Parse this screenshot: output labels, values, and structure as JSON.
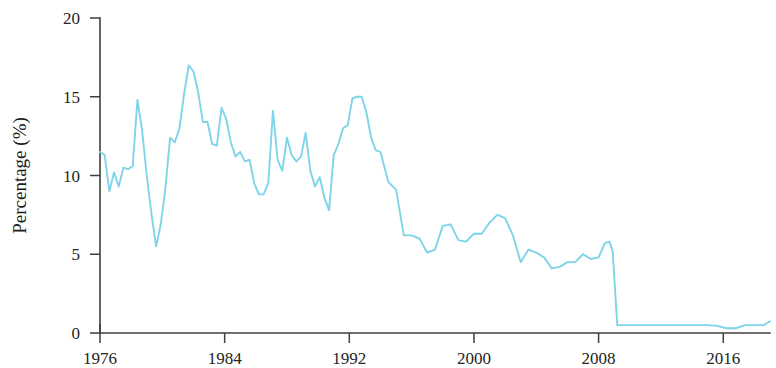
{
  "chart_data": {
    "type": "line",
    "title": "",
    "xlabel": "",
    "ylabel": "Percentage (%)",
    "xlim": [
      1976,
      2019
    ],
    "ylim": [
      0,
      20
    ],
    "xticks": [
      1976,
      1984,
      1992,
      2000,
      2008,
      2016
    ],
    "xtick_labels": [
      "1976",
      "1984",
      "1992",
      "2000",
      "2008",
      "2016"
    ],
    "yticks": [
      0,
      5,
      10,
      15,
      20
    ],
    "ytick_labels": [
      "0",
      "5",
      "10",
      "15",
      "20"
    ],
    "grid": false,
    "legend": false,
    "series": [
      {
        "name": "Percentage",
        "color": "#7ed4e8",
        "x": [
          1976.0,
          1976.3,
          1976.6,
          1976.9,
          1977.2,
          1977.5,
          1977.8,
          1978.1,
          1978.4,
          1978.7,
          1979.0,
          1979.3,
          1979.6,
          1979.9,
          1980.2,
          1980.5,
          1980.8,
          1981.1,
          1981.4,
          1981.7,
          1982.0,
          1982.3,
          1982.6,
          1982.9,
          1983.2,
          1983.5,
          1983.8,
          1984.1,
          1984.4,
          1984.7,
          1985.0,
          1985.3,
          1985.6,
          1985.9,
          1986.2,
          1986.5,
          1986.8,
          1987.1,
          1987.4,
          1987.7,
          1988.0,
          1988.3,
          1988.6,
          1988.9,
          1989.2,
          1989.5,
          1989.8,
          1990.1,
          1990.4,
          1990.7,
          1991.0,
          1991.3,
          1991.6,
          1991.9,
          1992.2,
          1992.5,
          1992.8,
          1993.1,
          1993.4,
          1993.7,
          1994.0,
          1994.5,
          1995.0,
          1995.5,
          1996.0,
          1996.5,
          1997.0,
          1997.5,
          1998.0,
          1998.5,
          1999.0,
          1999.5,
          2000.0,
          2000.5,
          2001.0,
          2001.5,
          2002.0,
          2002.5,
          2003.0,
          2003.5,
          2004.0,
          2004.5,
          2005.0,
          2005.5,
          2006.0,
          2006.5,
          2007.0,
          2007.5,
          2008.0,
          2008.4,
          2008.7,
          2008.9,
          2009.2,
          2010.0,
          2011.0,
          2012.0,
          2013.0,
          2014.0,
          2015.0,
          2015.6,
          2016.2,
          2016.8,
          2017.4,
          2018.0,
          2018.6,
          2019.0
        ],
        "y": [
          11.5,
          11.3,
          9.0,
          10.2,
          9.3,
          10.5,
          10.4,
          10.6,
          14.8,
          12.9,
          10.0,
          7.6,
          5.5,
          6.9,
          9.2,
          12.4,
          12.1,
          13.0,
          15.2,
          17.0,
          16.6,
          15.3,
          13.4,
          13.4,
          12.0,
          11.9,
          14.3,
          13.6,
          12.1,
          11.2,
          11.5,
          10.9,
          11.0,
          9.5,
          8.8,
          8.8,
          9.5,
          14.1,
          11.0,
          10.3,
          12.4,
          11.3,
          10.9,
          11.2,
          12.7,
          10.3,
          9.3,
          9.9,
          8.6,
          7.8,
          11.3,
          12.0,
          13.0,
          13.2,
          14.9,
          15.0,
          15.0,
          14.0,
          12.4,
          11.6,
          11.5,
          9.6,
          9.1,
          6.2,
          6.2,
          6.0,
          5.1,
          5.3,
          6.8,
          6.9,
          5.9,
          5.8,
          6.3,
          6.3,
          7.0,
          7.5,
          7.3,
          6.2,
          4.5,
          5.3,
          5.1,
          4.8,
          4.1,
          4.2,
          4.5,
          4.5,
          5.0,
          4.7,
          4.8,
          5.7,
          5.8,
          5.2,
          0.5,
          0.5,
          0.5,
          0.5,
          0.5,
          0.5,
          0.5,
          0.45,
          0.3,
          0.3,
          0.5,
          0.5,
          0.5,
          0.75
        ]
      }
    ]
  },
  "axes": {
    "y_axis_title": "Percentage (%)"
  }
}
